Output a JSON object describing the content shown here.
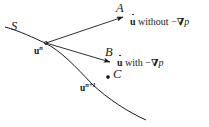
{
  "figure": {
    "kind": "vector-diagram",
    "background_color": "#ffffff",
    "ink_color": "#1a1a1a",
    "curve_label": "S",
    "points": [
      {
        "id": "A",
        "label": "A"
      },
      {
        "id": "B",
        "label": "B"
      },
      {
        "id": "C",
        "label": "C"
      }
    ],
    "vectors": [
      {
        "id": "u-n",
        "base": "u",
        "superscript": "n"
      },
      {
        "id": "u-n-plus-1",
        "base": "u",
        "superscript": "n+1"
      }
    ],
    "annotations": [
      {
        "id": "without-pressure-gradient",
        "symbol": "u",
        "dot": true,
        "text": "without",
        "minus": "−",
        "nabla": "∇",
        "field": "p",
        "full": "u̇ without −∇p"
      },
      {
        "id": "with-pressure-gradient",
        "symbol": "u",
        "dot": true,
        "text": "with",
        "minus": "−",
        "nabla": "∇",
        "field": "p",
        "full": "u̇ with −∇p"
      }
    ]
  }
}
